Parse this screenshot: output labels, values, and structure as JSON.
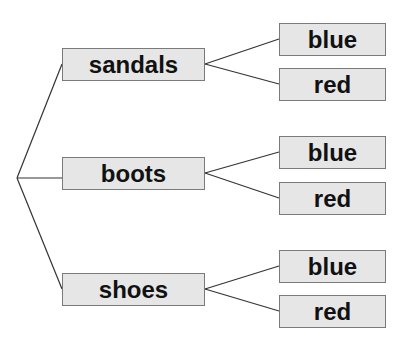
{
  "diagram": {
    "type": "tree",
    "orientation": "left-to-right",
    "root": {
      "x": 17,
      "y": 178
    },
    "colors": {
      "node_fill": "#e6e6e6",
      "node_border": "#7a7a7a",
      "line": "#333333",
      "text": "#111111"
    },
    "branches": [
      {
        "label": "sandals",
        "children": [
          {
            "label": "blue"
          },
          {
            "label": "red"
          }
        ]
      },
      {
        "label": "boots",
        "children": [
          {
            "label": "blue"
          },
          {
            "label": "red"
          }
        ]
      },
      {
        "label": "shoes",
        "children": [
          {
            "label": "blue"
          },
          {
            "label": "red"
          }
        ]
      }
    ]
  }
}
